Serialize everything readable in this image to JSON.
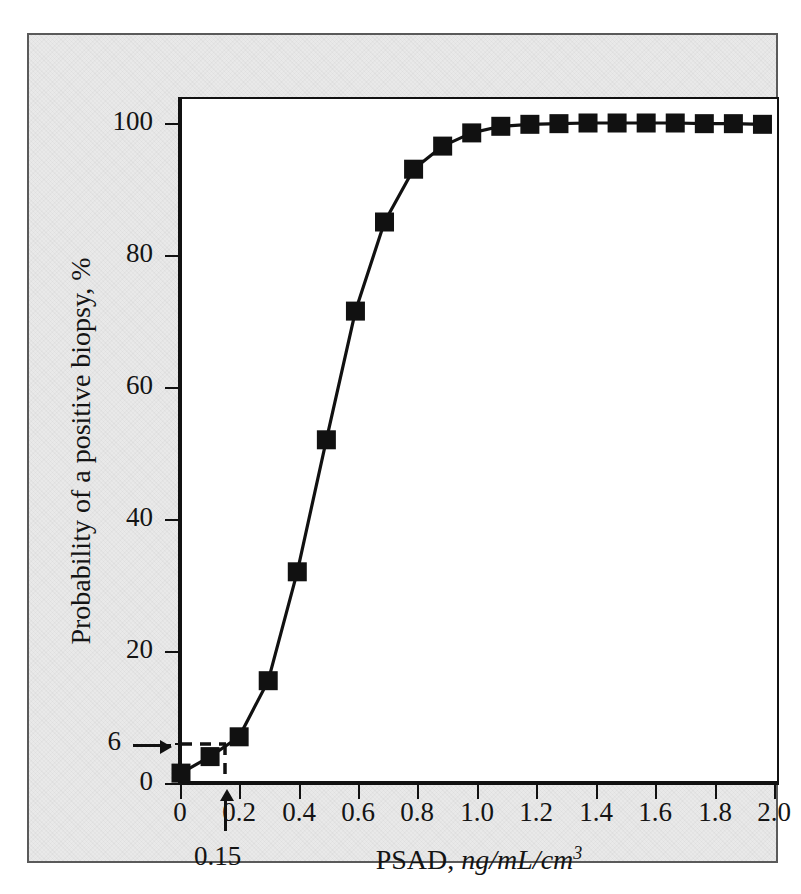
{
  "figure": {
    "background_color": "#e9e9e9",
    "plot_background_color": "#ffffff",
    "frame_color": "#5a5a5a",
    "ink_color": "#111111"
  },
  "chart_data": {
    "type": "line",
    "title": "",
    "xlabel_text": "PSAD, ",
    "xlabel_units": "ng/mL/cm",
    "xlabel_units_exponent": "3",
    "ylabel": "Probability of a positive biopsy, %",
    "xlim": [
      0,
      2.05
    ],
    "ylim": [
      0,
      103.5
    ],
    "grid": false,
    "legend": false,
    "marker": "filled-square",
    "xticks": [
      0,
      0.2,
      0.4,
      0.6,
      0.8,
      1.0,
      1.2,
      1.4,
      1.6,
      1.8,
      2.0
    ],
    "xticklabels": [
      "0",
      "0.2",
      "0.4",
      "0.6",
      "0.8",
      "1.0",
      "1.2",
      "1.4",
      "1.6",
      "1.8",
      "2.0"
    ],
    "yticks": [
      0,
      6,
      20,
      40,
      60,
      80,
      100
    ],
    "yticklabels": [
      "0",
      "6",
      "20",
      "40",
      "60",
      "80",
      "100"
    ],
    "x": [
      0.0,
      0.1,
      0.2,
      0.3,
      0.4,
      0.5,
      0.6,
      0.7,
      0.8,
      0.9,
      1.0,
      1.1,
      1.2,
      1.3,
      1.4,
      1.5,
      1.6,
      1.7,
      1.8,
      1.9,
      2.0
    ],
    "y": [
      1.5,
      4.0,
      7.0,
      15.5,
      32.0,
      52.0,
      71.5,
      85.0,
      93.0,
      96.5,
      98.5,
      99.5,
      99.8,
      99.9,
      100.0,
      100.0,
      100.0,
      100.0,
      99.9,
      99.9,
      99.8
    ],
    "series": [
      {
        "name": "Probability of a positive biopsy",
        "values": [
          1.5,
          4.0,
          7.0,
          15.5,
          32.0,
          52.0,
          71.5,
          85.0,
          93.0,
          96.5,
          98.5,
          99.5,
          99.8,
          99.9,
          100.0,
          100.0,
          100.0,
          100.0,
          99.9,
          99.9,
          99.8
        ]
      }
    ],
    "annotations": {
      "y_reference_value": 6,
      "y_reference_label": "6",
      "x_reference_value": 0.15,
      "x_reference_label": "0.15",
      "dashed_guide": true,
      "y_arrow_direction": "right",
      "x_arrow_direction": "up"
    }
  }
}
